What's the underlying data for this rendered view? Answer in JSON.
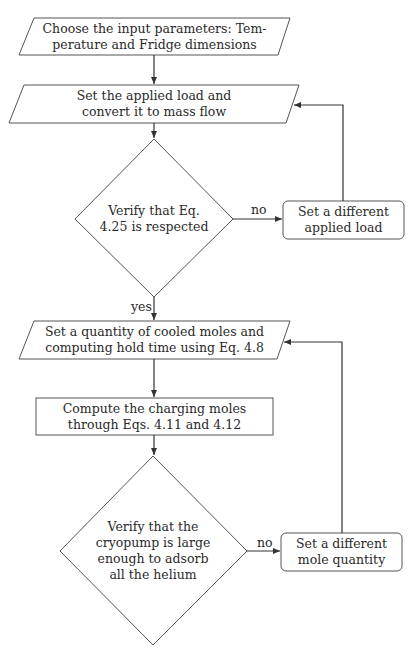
{
  "diagram": {
    "type": "flowchart",
    "colors": {
      "stroke": "#555555",
      "edge": "#333333",
      "text": "#2a2a2a",
      "background": "#ffffff"
    },
    "nodes": [
      {
        "id": "input-params",
        "shape": "parallelogram",
        "lines": [
          "Choose the input parameters: Tem-",
          "perature and Fridge dimensions"
        ]
      },
      {
        "id": "set-load",
        "shape": "parallelogram",
        "lines": [
          "Set the applied load and",
          "convert it to mass flow"
        ]
      },
      {
        "id": "verify-eq",
        "shape": "diamond",
        "lines": [
          "Verify that Eq.",
          "4.25 is respected"
        ]
      },
      {
        "id": "different-load",
        "shape": "rounded-rect",
        "lines": [
          "Set a different",
          "applied load"
        ]
      },
      {
        "id": "set-moles",
        "shape": "parallelogram",
        "lines": [
          "Set a quantity of cooled moles and",
          "computing hold time using Eq. 4.8"
        ]
      },
      {
        "id": "compute-charging",
        "shape": "rect",
        "lines": [
          "Compute the charging moles",
          "through Eqs. 4.11 and 4.12"
        ]
      },
      {
        "id": "verify-cryopump",
        "shape": "diamond",
        "lines": [
          "Verify that the",
          "cryopump is large",
          "enough to adsorb",
          "all the helium"
        ]
      },
      {
        "id": "different-moles",
        "shape": "rounded-rect",
        "lines": [
          "Set a different",
          "mole quantity"
        ]
      }
    ],
    "edges": [
      {
        "from": "input-params",
        "to": "set-load",
        "label": ""
      },
      {
        "from": "set-load",
        "to": "verify-eq",
        "label": ""
      },
      {
        "from": "verify-eq",
        "to": "different-load",
        "label": "no"
      },
      {
        "from": "different-load",
        "to": "set-load",
        "label": ""
      },
      {
        "from": "verify-eq",
        "to": "set-moles",
        "label": "yes"
      },
      {
        "from": "set-moles",
        "to": "compute-charging",
        "label": ""
      },
      {
        "from": "compute-charging",
        "to": "verify-cryopump",
        "label": ""
      },
      {
        "from": "verify-cryopump",
        "to": "different-moles",
        "label": "no"
      },
      {
        "from": "different-moles",
        "to": "set-moles",
        "label": ""
      }
    ],
    "edge_labels": {
      "no1": "no",
      "yes1": "yes",
      "no2": "no"
    }
  }
}
